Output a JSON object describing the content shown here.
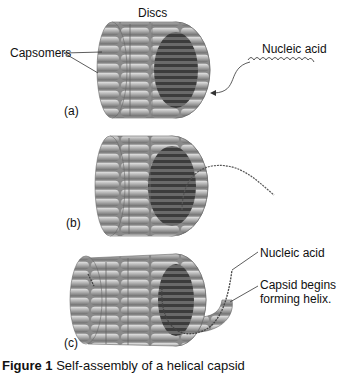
{
  "figure": {
    "panels": [
      {
        "id": "a",
        "label": "(a)",
        "annotations": {
          "top": "Discs",
          "left": "Capsomers",
          "right": "Nucleic acid"
        }
      },
      {
        "id": "b",
        "label": "(b)"
      },
      {
        "id": "c",
        "label": "(c)",
        "annotations": {
          "nucleic_acid": "Nucleic acid",
          "capsid": "Capsid begins forming helix.",
          "capsid_line1": "Capsid begins",
          "capsid_line2": "forming helix."
        }
      }
    ],
    "caption": {
      "number": "Figure 1",
      "text": "Self-assembly of a helical capsid"
    }
  },
  "colors": {
    "capsomer_fill": "#9a9a9a",
    "capsomer_highlight": "#d8d8d8",
    "interior": "#4a4a4a",
    "nucleic_acid": "#555555"
  }
}
